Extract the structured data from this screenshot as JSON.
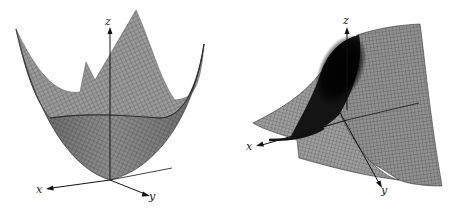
{
  "figures": [
    {
      "id": "left",
      "description": "Paraboloid surface z = x^2 + y^2 (upward-opening bowl) rendered as gray mesh",
      "axes": {
        "x_label": "x",
        "y_label": "y",
        "z_label": "z"
      }
    },
    {
      "id": "right",
      "description": "Saddle-type surface rendered as gray mesh with dark shaded fold",
      "axes": {
        "x_label": "x",
        "y_label": "y",
        "z_label": "z"
      }
    }
  ],
  "colors": {
    "background": "#ffffff",
    "surface_fill": "#8a8a8a",
    "surface_light": "#a8a8a8",
    "mesh_line": "#3a3a3a",
    "shadow": "#111111",
    "axis": "#111111"
  }
}
